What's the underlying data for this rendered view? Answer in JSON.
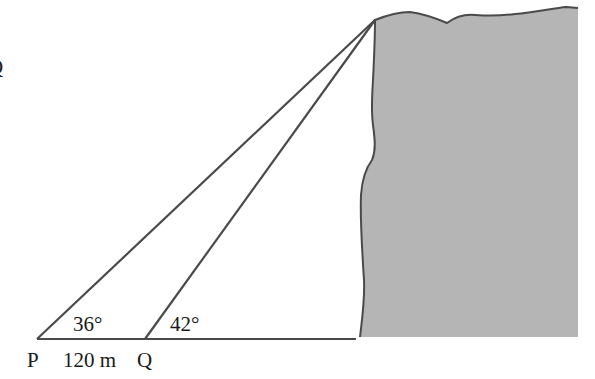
{
  "diagram": {
    "type": "trigonometry-angle-of-elevation",
    "points": {
      "P": {
        "label": "P",
        "x": 37,
        "y": 339
      },
      "Q": {
        "label": "Q",
        "x": 145,
        "y": 339
      },
      "apex": {
        "x": 375,
        "y": 20
      }
    },
    "labels": {
      "point_p": "P",
      "point_q": "Q",
      "distance_pq": "120 m",
      "angle_p": "36°",
      "angle_q": "42°",
      "partial_left_q": "Q"
    },
    "colors": {
      "cliff_fill": "#b5b5b5",
      "stroke": "#4a4a4a",
      "text": "#1a1a1a",
      "background": "#ffffff"
    }
  }
}
